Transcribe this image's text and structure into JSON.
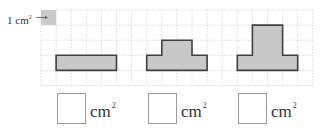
{
  "unit_label": {
    "prefix": "1 cm",
    "superscript": "2"
  },
  "grid": {
    "origin_x": 41,
    "origin_y": 10,
    "cell": 15.1,
    "cols": 18,
    "rows": 5,
    "line_color": "#cfcfcf",
    "unit_swatch_color": "#c9c9c9"
  },
  "shape_style": {
    "fill": "#c8c8c8",
    "stroke": "#3f3f3f"
  },
  "shapes": [
    {
      "name": "shape-1-rectangle",
      "cells_area": 4,
      "polygon_cells": [
        [
          1,
          3
        ],
        [
          5,
          3
        ],
        [
          5,
          4
        ],
        [
          1,
          4
        ]
      ]
    },
    {
      "name": "shape-2-t-shape",
      "cells_area": 6,
      "polygon_cells": [
        [
          7,
          3
        ],
        [
          8,
          3
        ],
        [
          8,
          2
        ],
        [
          10,
          2
        ],
        [
          10,
          3
        ],
        [
          11,
          3
        ],
        [
          11,
          4
        ],
        [
          7,
          4
        ]
      ]
    },
    {
      "name": "shape-3-tall-t-shape",
      "cells_area": 8,
      "polygon_cells": [
        [
          13,
          3
        ],
        [
          14,
          3
        ],
        [
          14,
          1
        ],
        [
          16,
          1
        ],
        [
          16,
          3
        ],
        [
          17,
          3
        ],
        [
          17,
          4
        ],
        [
          13,
          4
        ]
      ]
    }
  ],
  "answers": [
    {
      "value": "",
      "unit": "cm",
      "superscript": "2",
      "left": 57
    },
    {
      "value": "",
      "unit": "cm",
      "superscript": "2",
      "left": 148
    },
    {
      "value": "",
      "unit": "cm",
      "superscript": "2",
      "left": 238
    }
  ]
}
